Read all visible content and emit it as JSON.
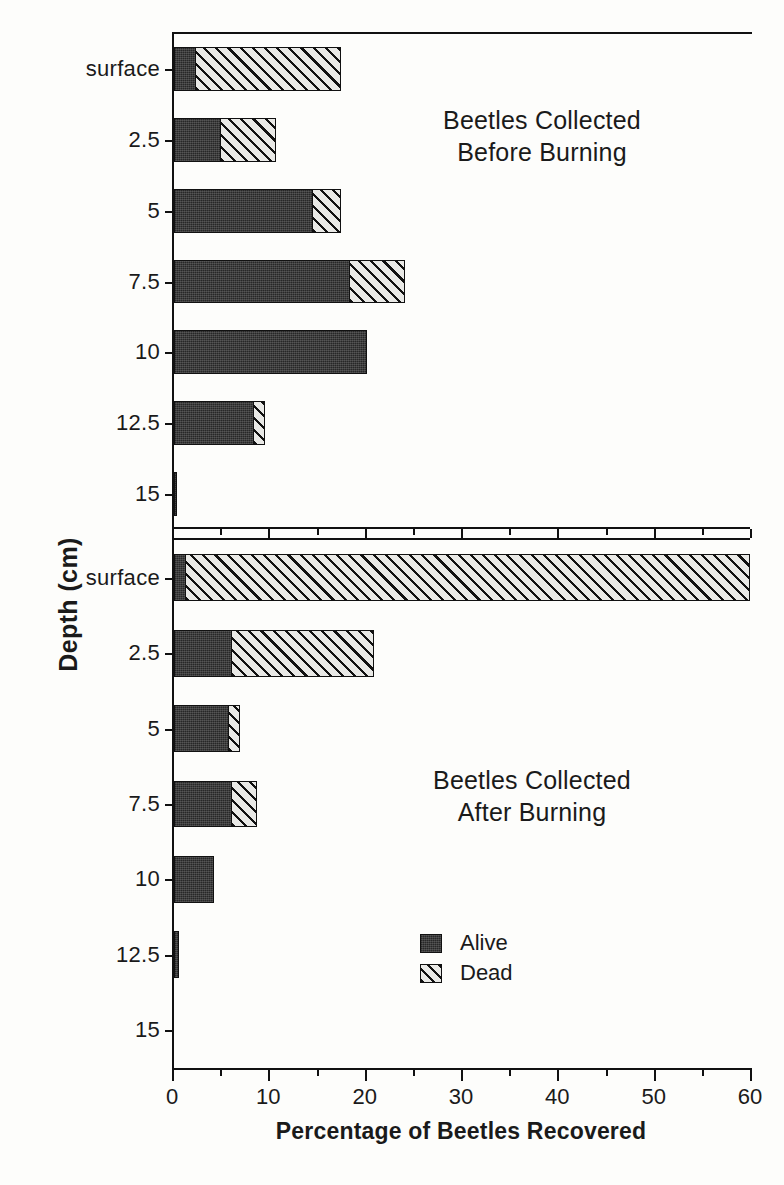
{
  "chart_data": {
    "type": "bar",
    "orientation": "horizontal",
    "stacked": true,
    "title": "",
    "xlabel": "Percentage of Beetles Recovered",
    "ylabel": "Depth (cm)",
    "xlim": [
      0,
      60
    ],
    "xticks": [
      0,
      10,
      20,
      30,
      40,
      50,
      60
    ],
    "xtick_labels": [
      "0",
      "10",
      "20",
      "30",
      "40",
      "50",
      "60"
    ],
    "xminor_ticks": [
      5,
      15,
      25,
      35,
      45,
      55
    ],
    "categories": [
      "surface",
      "2.5",
      "5",
      "7.5",
      "10",
      "12.5",
      "15"
    ],
    "grid": false,
    "legend_position": "lower-center",
    "legend": [
      {
        "name": "Alive",
        "fill": "solid-dark"
      },
      {
        "name": "Dead",
        "fill": "diagonal-hatch"
      }
    ],
    "panels": [
      {
        "id": "before",
        "title_line1": "Beetles Collected",
        "title_line2": "Before Burning",
        "series": [
          {
            "name": "Alive",
            "values": [
              2.3,
              4.9,
              14.5,
              18.3,
              20.0,
              8.4,
              0.3
            ]
          },
          {
            "name": "Dead",
            "values": [
              15.2,
              5.9,
              3.0,
              5.8,
              0.0,
              1.2,
              0.0
            ]
          }
        ],
        "totals": [
          17.5,
          10.8,
          17.5,
          24.1,
          20.0,
          9.6,
          0.3
        ]
      },
      {
        "id": "after",
        "title_line1": "Beetles Collected",
        "title_line2": "After Burning",
        "series": [
          {
            "name": "Alive",
            "values": [
              1.3,
              6.1,
              5.8,
              6.1,
              4.2,
              0.5,
              0.0
            ]
          },
          {
            "name": "Dead",
            "values": [
              58.7,
              14.8,
              1.2,
              2.7,
              0.0,
              0.0,
              0.0
            ]
          }
        ],
        "totals": [
          60.0,
          20.9,
          7.0,
          8.8,
          4.2,
          0.5,
          0.0
        ]
      }
    ]
  },
  "colors": {
    "alive": "#3c3c3c",
    "dead": "#e9e9e6",
    "axis": "#111111",
    "background": "#fdfdfb"
  }
}
